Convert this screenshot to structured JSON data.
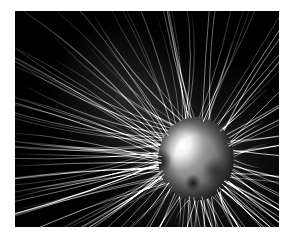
{
  "figure": {
    "title": "Magnetospheric field line visualization",
    "domain_subject": "magnetosphere",
    "render_style": "grayscale-3d",
    "background_color": "#000000",
    "border_color": "#ffffff",
    "line_color": "#d8d8d8",
    "sphere_highlight_color": "#ffffff",
    "sphere_midtone_color": "#9a9a9a",
    "sphere_shadow_color": "#3a3a3a",
    "canvas": {
      "frame_left": 15,
      "frame_top": 11,
      "frame_width": 264,
      "frame_height": 216
    },
    "sphere": {
      "center_x": 181,
      "center_y": 148,
      "radius_x": 38,
      "radius_y": 42,
      "highlight_x": 165,
      "highlight_y": 133,
      "dark_spot_1_x": 146,
      "dark_spot_1_y": 150,
      "dark_spot_2_x": 178,
      "dark_spot_2_y": 172,
      "dark_spot_3_x": 200,
      "dark_spot_3_y": 160
    },
    "field_groups": [
      {
        "name": "upper-left-diagonal-sheaf",
        "count": 26,
        "description": "Long straight bright lines sweeping from the sphere toward the upper-left corner at roughly thirty degrees above horizontal.",
        "origin_angle_start": 150,
        "origin_angle_end": 205,
        "brightness": 0.85
      },
      {
        "name": "upper-right-radial-fan",
        "count": 24,
        "description": "Radial lines fanning from the sphere toward the top and upper-right of the frame.",
        "origin_angle_start": 255,
        "origin_angle_end": 355,
        "brightness": 0.78
      },
      {
        "name": "crosshatch-mesh",
        "count": 30,
        "description": "Dense crosshatched mesh of field lines just above and left of the sphere where two line families overlap.",
        "origin_angle_start": 185,
        "origin_angle_end": 255,
        "brightness": 0.62
      },
      {
        "name": "lower-left-arcs",
        "count": 18,
        "description": "Broad curved arcs bending downward and to the left below the sphere.",
        "origin_angle_start": 95,
        "origin_angle_end": 165,
        "brightness": 0.58
      },
      {
        "name": "lower-right-bundle",
        "count": 28,
        "description": "Dense bundle of field lines sweeping down and to the right toward the bottom-right corner.",
        "origin_angle_start": 5,
        "origin_angle_end": 90,
        "brightness": 0.8
      },
      {
        "name": "near-sphere-loops",
        "count": 16,
        "description": "Short closed loops hugging the surface of the sphere.",
        "origin_angle_start": 0,
        "origin_angle_end": 360,
        "brightness": 0.7
      }
    ]
  }
}
